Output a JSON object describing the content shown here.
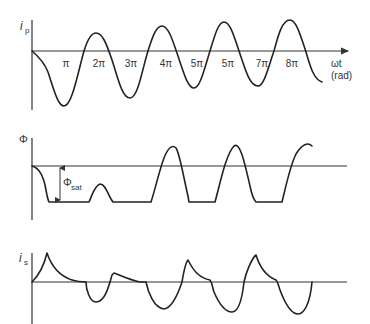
{
  "panels": {
    "primary_current": {
      "y_label": "i",
      "y_label_sub": "p",
      "x_ticks": [
        "π",
        "2π",
        "3π",
        "4π",
        "5π",
        "5π",
        "7π",
        "8π"
      ],
      "x_label_line1": "ωt",
      "x_label_line2": "(rad)"
    },
    "flux": {
      "y_label": "Φ",
      "annotation": "Φ",
      "annotation_sub": "sat"
    },
    "secondary_current": {
      "y_label": "i",
      "y_label_sub": "s"
    }
  },
  "colors": {
    "ink": "#222222",
    "axis": "#333333",
    "background": "#ffffff"
  }
}
